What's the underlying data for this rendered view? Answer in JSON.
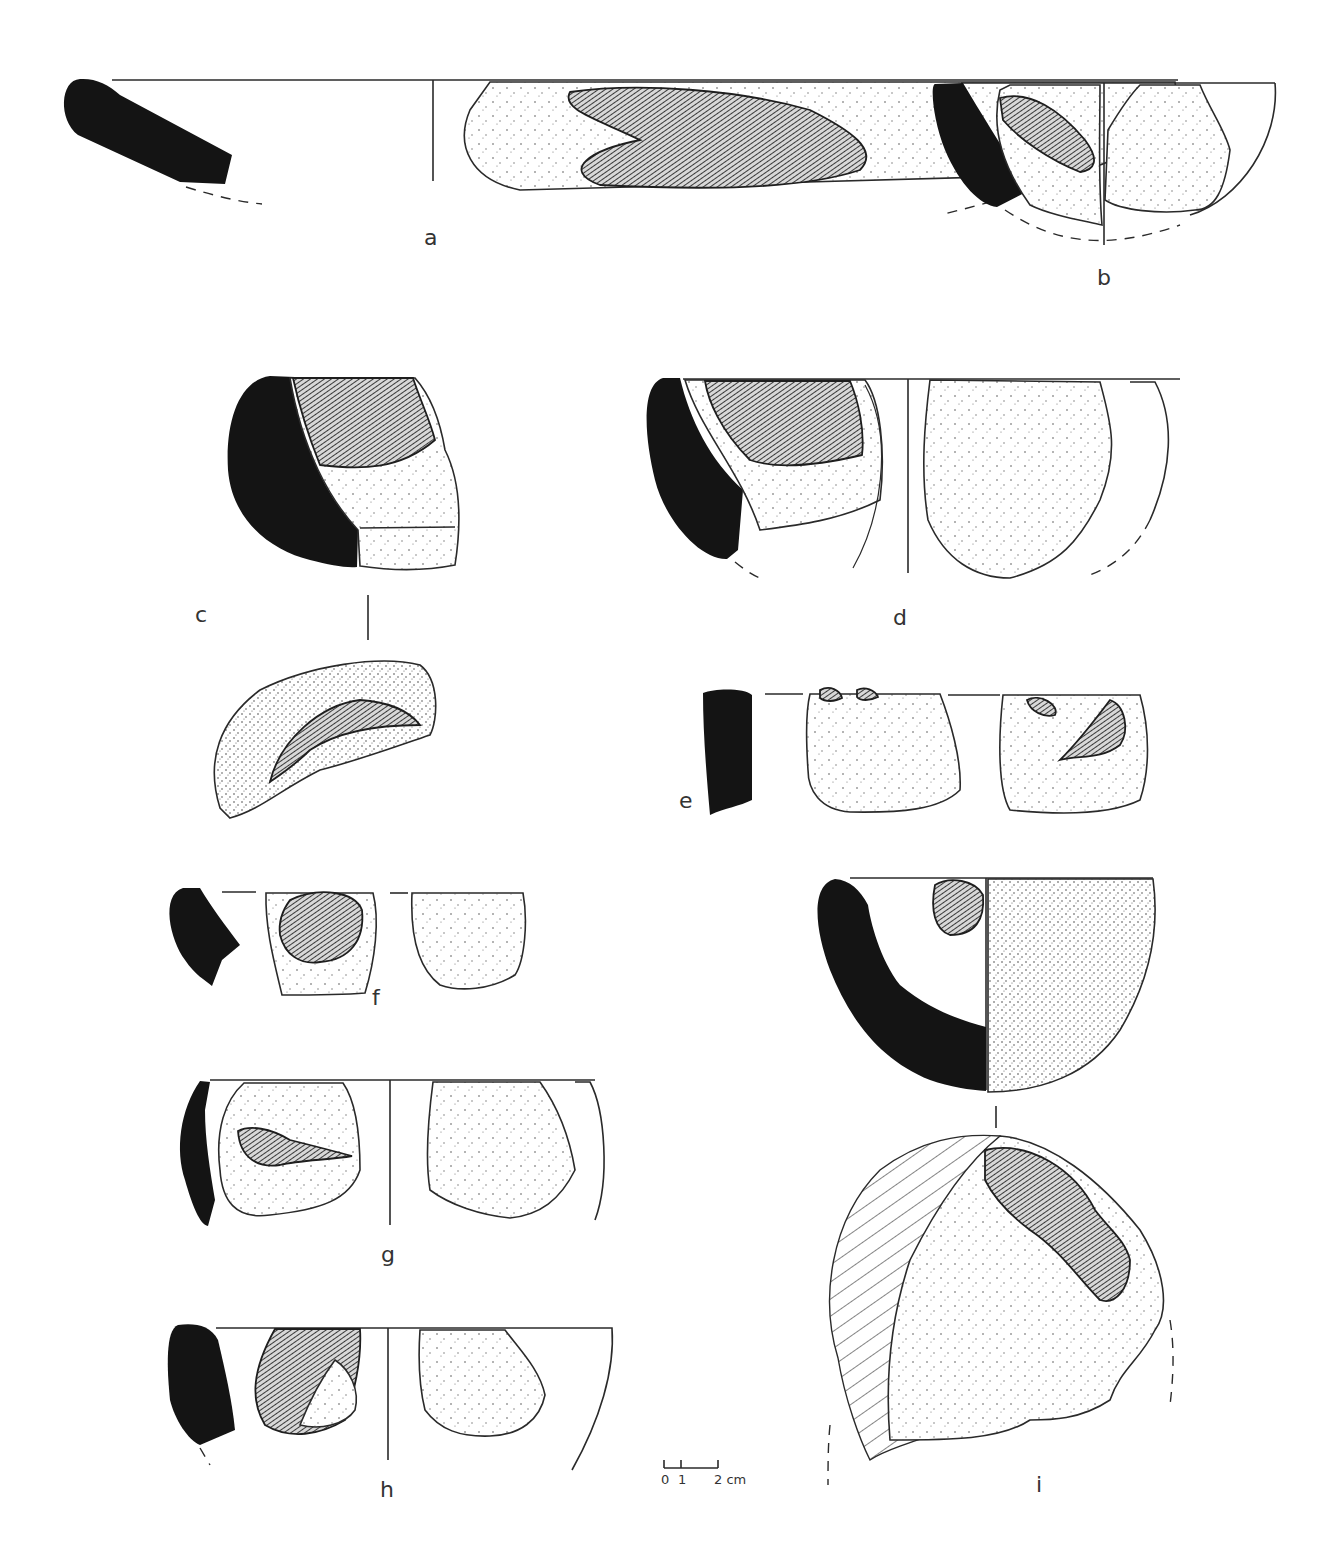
{
  "plate": {
    "figures": [
      {
        "id": "a",
        "label": "a",
        "description": "Shallow bowl rim fragment: black profile section, exterior view with hatched encrustation"
      },
      {
        "id": "b",
        "label": "b",
        "description": "Hemispherical bowl fragment: profile section, interior with hatched residue, exterior view, dashed reconstruction"
      },
      {
        "id": "c",
        "label": "c",
        "description": "Thick rim fragment: profile section with hatched and stippled surface, plus top view"
      },
      {
        "id": "d",
        "label": "d",
        "description": "Deep bowl fragment: profile section, hatched residue band, exterior view, dashed reconstruction"
      },
      {
        "id": "e",
        "label": "e",
        "description": "Straight-walled rim fragment: profile section, interior and exterior views"
      },
      {
        "id": "f",
        "label": "f",
        "description": "Small rim fragment: profile section, interior and exterior views"
      },
      {
        "id": "g",
        "label": "g",
        "description": "Rim fragment: profile section, interior with residue, exterior view"
      },
      {
        "id": "h",
        "label": "h",
        "description": "Rim fragment: profile section, hatched interior, exterior view"
      },
      {
        "id": "i",
        "label": "i",
        "description": "Deep hemispherical vessel: profile section with stippled exterior, plus base/top view with diagonal hatched break surfaces"
      }
    ],
    "scale_bar": {
      "ticks": [
        "0",
        "1",
        "2 cm"
      ],
      "unit": "cm"
    }
  }
}
